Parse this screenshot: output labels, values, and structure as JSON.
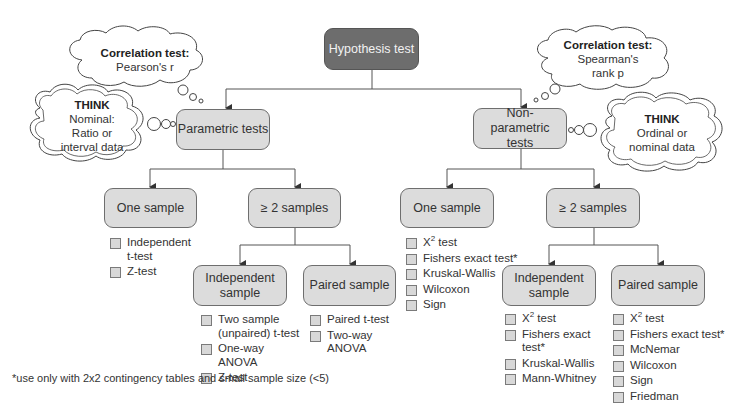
{
  "root": {
    "label": "Hypothesis test"
  },
  "branches": {
    "parametric": {
      "label": "Parametric tests",
      "correlation_cloud": {
        "title": "Correlation test:",
        "text": "Pearson's r"
      },
      "think_cloud": {
        "title": "THINK",
        "lines": [
          "Nominal:",
          "Ratio or",
          "interval data"
        ]
      },
      "one_sample": {
        "label": "One sample",
        "tests": [
          "Independent t-test",
          "Z-test"
        ]
      },
      "two_plus": {
        "label": "≥ 2 samples",
        "independent": {
          "label": "Independent sample",
          "tests": [
            "Two sample (unpaired) t-test",
            "One-way ANOVA",
            "Z-test"
          ]
        },
        "paired": {
          "label": "Paired sample",
          "tests": [
            "Paired t-test",
            "Two-way ANOVA"
          ]
        }
      }
    },
    "nonparametric": {
      "label": "Non-parametric tests",
      "correlation_cloud": {
        "title": "Correlation test:",
        "lines": [
          "Spearman's",
          "rank p"
        ]
      },
      "think_cloud": {
        "title": "THINK",
        "lines": [
          "Ordinal or",
          "nominal data"
        ]
      },
      "one_sample": {
        "label": "One sample",
        "tests": [
          "X2 test",
          "Fishers exact test*",
          "Kruskal-Wallis",
          "Wilcoxon",
          "Sign"
        ]
      },
      "two_plus": {
        "label": "≥ 2 samples",
        "independent": {
          "label": "Independent sample",
          "tests": [
            "X2 test",
            "Fishers exact test*",
            "Kruskal-Wallis",
            "Mann-Whitney"
          ]
        },
        "paired": {
          "label": "Paired sample",
          "tests": [
            "X2 test",
            "Fishers exact test*",
            "McNemar",
            "Wilcoxon",
            "Sign",
            "Friedman"
          ]
        }
      }
    }
  },
  "footnote": "*use only with 2x2 contingency tables and small sample size (<5)",
  "colors": {
    "root_fill": "#6d6d6d",
    "node_fill": "#dcdcdc",
    "line": "#555555"
  }
}
